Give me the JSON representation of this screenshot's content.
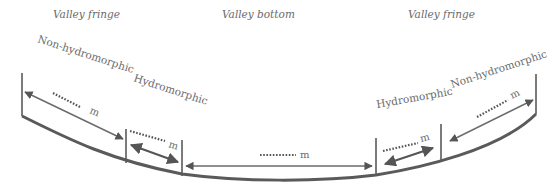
{
  "zones": {
    "left_fringe": "Valley fringe",
    "bottom": "Valley bottom",
    "right_fringe": "Valley fringe"
  },
  "sub_zones": {
    "left_non_hydro": "Non-hydromorphic",
    "left_hydro": "Hydromorphic",
    "right_hydro": "Hydromorphic",
    "right_non_hydro": "Non-hydromorphic"
  },
  "widths": {
    "unit": "m",
    "left_non_hydro": "m",
    "left_hydro": "m",
    "bottom": "m",
    "right_hydro": "m",
    "right_non_hydro": "m"
  },
  "colors": {
    "line": "#5a5a5a",
    "text": "#6a6a6a"
  }
}
